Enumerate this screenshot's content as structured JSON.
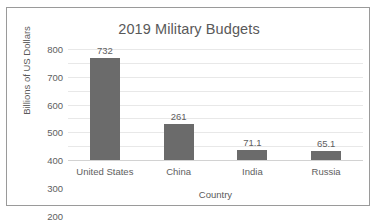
{
  "chart_data": {
    "type": "bar",
    "title": "2019 Military Budgets",
    "xlabel": "Country",
    "ylabel": "Billions of US Dollars",
    "categories": [
      "United States",
      "China",
      "India",
      "Russia"
    ],
    "values": [
      732,
      261,
      71.1,
      65.1
    ],
    "value_labels": [
      "732",
      "261",
      "71.1",
      "65.1"
    ],
    "ylim": [
      0,
      800
    ],
    "yticks": [
      0,
      100,
      200,
      300,
      400,
      500,
      600,
      700,
      800
    ],
    "ytick_labels": [
      "0",
      "100",
      "200",
      "300",
      "400",
      "500",
      "600",
      "700",
      "800"
    ],
    "grid": true,
    "legend": false,
    "series": [
      {
        "name": "Budget",
        "values": [
          732,
          261,
          71.1,
          65.1
        ]
      }
    ],
    "colors": {
      "bar": "#6b6b6b",
      "gridline": "#e8e8e8",
      "axis": "#d2d2d2",
      "text": "#5e5e5e",
      "title_text": "#595959",
      "background": "#ffffff",
      "border": "#9a9a9a"
    }
  }
}
